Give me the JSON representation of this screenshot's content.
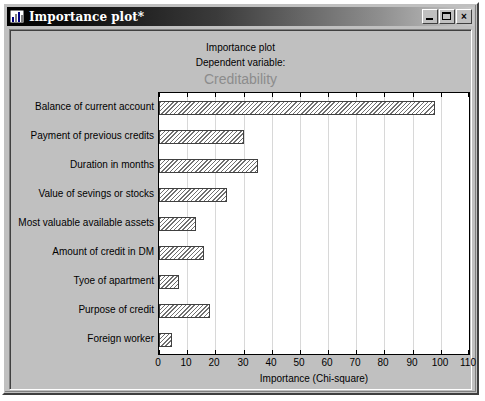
{
  "window": {
    "title": "Importance plot*",
    "icon": "bar-chart-icon",
    "buttons": {
      "minimize": "_",
      "maximize": "□",
      "close": "×"
    }
  },
  "chart_data": {
    "type": "bar",
    "orientation": "horizontal",
    "title": "Importance plot",
    "subtitle": "Dependent variable:",
    "dependent_variable": "Creditability",
    "xlabel": "Importance (Chi-square)",
    "ylabel": "",
    "xlim": [
      0,
      110
    ],
    "xticks": [
      0,
      10,
      20,
      30,
      40,
      50,
      60,
      70,
      80,
      90,
      100,
      110
    ],
    "grid": true,
    "legend": "none",
    "categories": [
      "Balance of current account",
      "Payment of previous credits",
      "Duration in months",
      "Value of sevings or stocks",
      "Most valuable available assets",
      "Amount of credit in DM",
      "Tyoe of apartment",
      "Purpose of credit",
      "Foreign worker"
    ],
    "values": [
      98,
      30,
      35,
      24,
      13,
      16,
      7,
      18,
      4.5
    ],
    "bar_style": {
      "fill": "diagonal-hatch",
      "hatch_color": "#707070",
      "background": "#ffffff",
      "border": "#404040"
    }
  },
  "colors": {
    "window_face": "#c0c0c0",
    "titlebar_start": "#000000",
    "titlebar_end": "#c8c8c8",
    "plot_background": "#ffffff",
    "depvar_text": "#8c8c8c",
    "gridline": "#d8d8d8"
  }
}
